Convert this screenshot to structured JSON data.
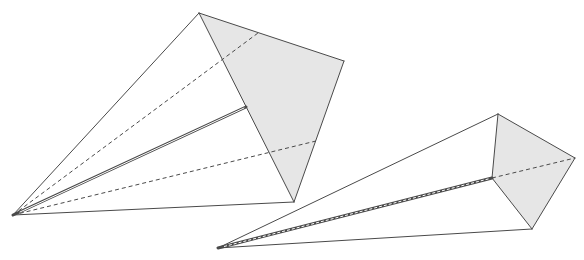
{
  "diagram": {
    "colors": {
      "stroke": "#4a4a4a",
      "face_fill": "#e6e6e6",
      "background": "#ffffff"
    },
    "shapes": [
      {
        "name": "pyramid-1",
        "apex": [
          13,
          215
        ],
        "top": [
          199,
          13
        ],
        "right": [
          344,
          61
        ],
        "bottom": [
          294,
          202
        ],
        "edge_point": [
          246,
          107
        ],
        "dash_upper_end": [
          258,
          33
        ],
        "dash_lower_end": [
          316,
          141
        ]
      },
      {
        "name": "pyramid-2",
        "apex": [
          218,
          248
        ],
        "top": [
          498,
          114
        ],
        "right": [
          575,
          158
        ],
        "bottom": [
          532,
          229
        ],
        "mid": [
          492,
          178
        ]
      }
    ]
  }
}
